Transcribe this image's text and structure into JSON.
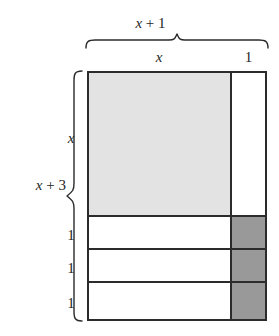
{
  "figure": {
    "type": "area-model",
    "top_total_label": "x + 1",
    "left_total_label": "x + 3",
    "column_labels": [
      "x",
      "1"
    ],
    "row_labels": [
      "x",
      "1",
      "1",
      "1"
    ],
    "colors": {
      "light_fill": "#e3e3e3",
      "dark_fill": "#999999",
      "white_fill": "#ffffff",
      "stroke": "#2b2b2b",
      "text": "#262626",
      "background": "#ffffff"
    },
    "cells": [
      {
        "row": "x",
        "col": "x",
        "fill": "light",
        "area": "x^2"
      },
      {
        "row": "x",
        "col": "1",
        "fill": "white",
        "area": "x"
      },
      {
        "row": "1",
        "col": "x",
        "fill": "white",
        "area": "x"
      },
      {
        "row": "1",
        "col": "1",
        "fill": "dark",
        "area": "1"
      },
      {
        "row": "1",
        "col": "x",
        "fill": "white",
        "area": "x"
      },
      {
        "row": "1",
        "col": "1",
        "fill": "dark",
        "area": "1"
      },
      {
        "row": "1",
        "col": "x",
        "fill": "white",
        "area": "x"
      },
      {
        "row": "1",
        "col": "1",
        "fill": "dark",
        "area": "1"
      }
    ],
    "parts": {
      "x_term": "x",
      "one_term": "1",
      "three_term": "3",
      "plus": "+"
    }
  }
}
